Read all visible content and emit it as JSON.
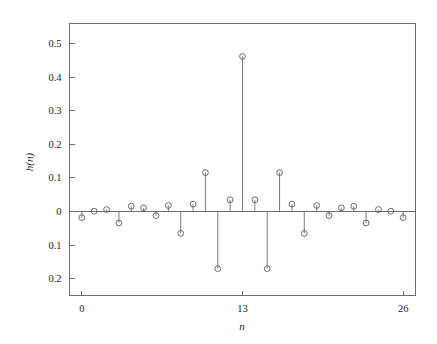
{
  "figure": {
    "background_color": "#ffffff",
    "line_color": "#6e6e6e",
    "marker_color": "#5a5a5a",
    "text_color": "#242424"
  },
  "axes": {
    "y_label": "h(n)",
    "x_label": "n",
    "y_tick_labels": [
      "0.5",
      "0.4",
      "0.3",
      "0.2",
      "0.1",
      "0",
      "0.1",
      "0.2"
    ],
    "y_tick_values": [
      0.5,
      0.4,
      0.3,
      0.2,
      0.1,
      0,
      -0.1,
      -0.2
    ],
    "x_tick_labels": [
      "0",
      "13",
      "26"
    ],
    "x_tick_values": [
      0,
      13,
      26
    ]
  },
  "chart_data": {
    "type": "stem",
    "title": "",
    "subtitle": "",
    "xlabel": "n",
    "ylabel": "h(n)",
    "xlim": [
      -1,
      27
    ],
    "ylim": [
      -0.25,
      0.56
    ],
    "grid": false,
    "legend": null,
    "marker": "circle-open",
    "x": [
      0,
      1,
      2,
      3,
      4,
      5,
      6,
      7,
      8,
      9,
      10,
      11,
      12,
      13,
      14,
      15,
      16,
      17,
      18,
      19,
      20,
      21,
      22,
      23,
      24,
      25,
      26
    ],
    "values": [
      -0.018,
      0.001,
      0.006,
      -0.034,
      0.016,
      0.011,
      -0.012,
      0.018,
      -0.065,
      0.022,
      0.116,
      -0.17,
      0.035,
      0.462,
      0.035,
      -0.17,
      0.116,
      0.022,
      -0.065,
      0.018,
      -0.012,
      0.011,
      0.016,
      -0.034,
      0.006,
      0.001,
      -0.018
    ],
    "annotations": []
  }
}
